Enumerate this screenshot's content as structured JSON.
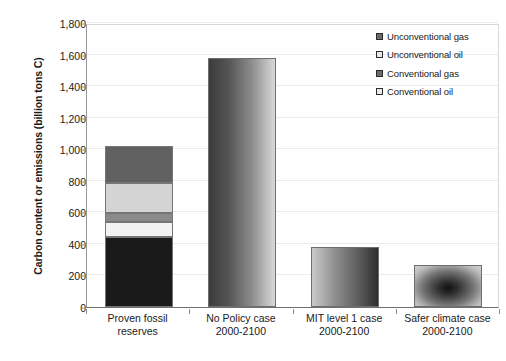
{
  "chart_data": {
    "type": "bar",
    "title": "",
    "subtitle": "",
    "xlabel": "",
    "ylabel": "Carbon content or emissions (billion tons C)",
    "ylim": [
      0,
      1800
    ],
    "ytick_step": 200,
    "grid": true,
    "legend_position": "top-right",
    "categories": [
      "Proven fossil\nreserves",
      "No Policy case\n2000-2100",
      "MIT level 1 case\n2000-2100",
      "Safer climate case\n2000-2100"
    ],
    "ytick_labels": [
      "0",
      "200",
      "400",
      "600",
      "800",
      "1,000",
      "1,200",
      "1,400",
      "1,600",
      "1,800"
    ],
    "ytick_values": [
      0,
      200,
      400,
      600,
      800,
      1000,
      1200,
      1400,
      1600,
      1800
    ],
    "series": [
      {
        "name": "Conventional oil",
        "color": "#1a1a1a",
        "values": [
          445,
          0,
          0,
          0
        ]
      },
      {
        "name": "Conventional gas",
        "color": "#f2f2f2",
        "values": [
          95,
          0,
          0,
          0
        ]
      },
      {
        "name": "Unconventional oil",
        "color": "#8a8a8a",
        "values": [
          55,
          0,
          0,
          0
        ]
      },
      {
        "name": "Unconventional gas",
        "color": "#d4d4d4",
        "values": [
          190,
          0,
          0,
          0
        ]
      },
      {
        "name": "Unconventional gas (top)",
        "color": "#616161",
        "values": [
          235,
          0,
          0,
          0
        ]
      }
    ],
    "totals": [
      1025,
      1580,
      380,
      265
    ],
    "bar_notes": [
      "stacked: 5 segments",
      "single bar, horizontal gradient dark-to-light",
      "single bar, horizontal gradient light-to-dark",
      "single bar, radial gradient dark center"
    ]
  },
  "legend": {
    "items": [
      {
        "label": "Unconventional gas",
        "swatch": "dark"
      },
      {
        "label": "Unconventional oil",
        "swatch": "light"
      },
      {
        "label": "Conventional gas",
        "swatch": "dark"
      },
      {
        "label": "Conventional oil",
        "swatch": "light"
      }
    ]
  }
}
